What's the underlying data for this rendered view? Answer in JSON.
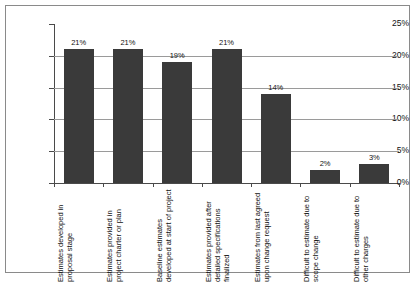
{
  "chart_data": {
    "type": "bar",
    "title": "",
    "subtitle": "",
    "xlabel": "",
    "ylabel": "",
    "ylim": [
      0,
      25
    ],
    "y_tick_labels": [
      "0%",
      "5%",
      "10%",
      "15%",
      "20%",
      "25%"
    ],
    "y_ticks": [
      0,
      5,
      10,
      15,
      20,
      25
    ],
    "grid": "horizontal",
    "legend": "none",
    "bar_color": "#3a3a3a",
    "categories": [
      "Estimates developed in proposal stage",
      "Estimates provided in project charter or plan",
      "Baseline estimates developed at start of project",
      "Estimates provided after detailed specifications finalized",
      "Estimates from last agreed upon change request",
      "Difficult to estimate due to scope change",
      "Difficult to estimate due to other charges"
    ],
    "values": [
      21,
      21,
      19,
      21,
      14,
      2,
      3
    ],
    "value_labels": [
      "21%",
      "21%",
      "19%",
      "21%",
      "14%",
      "2%",
      "3%"
    ]
  }
}
